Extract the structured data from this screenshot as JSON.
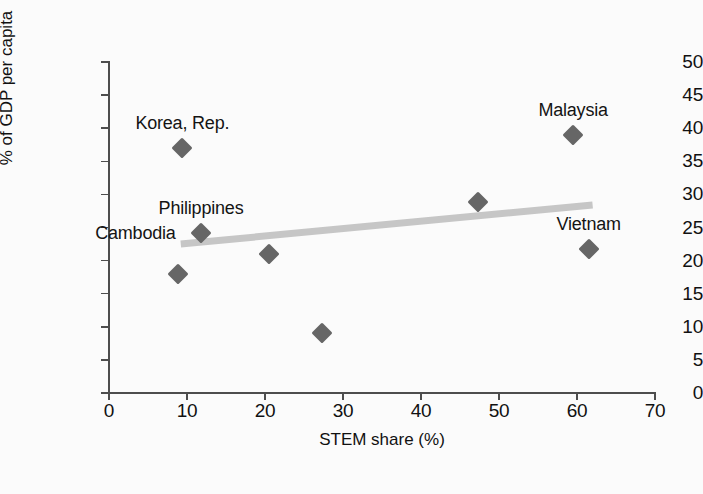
{
  "chart_data": {
    "type": "scatter",
    "title": "",
    "subtitle": "",
    "xlabel": "STEM share (%)",
    "ylabel": "% of GDP per capita",
    "xlim": [
      0,
      70
    ],
    "ylim": [
      0,
      50
    ],
    "xticks": [
      0,
      10,
      20,
      30,
      40,
      50,
      60,
      70
    ],
    "yticks": [
      0,
      5,
      10,
      15,
      20,
      25,
      30,
      35,
      40,
      45,
      50
    ],
    "grid": false,
    "legend": "none",
    "marker_shape": "diamond",
    "marker_color": "#666666",
    "points": [
      {
        "label": "Cambodia",
        "x": 8.8,
        "y": 18.0,
        "label_dx": -2,
        "label_dy": -30,
        "label_anchor": "end"
      },
      {
        "label": "Korea, Rep.",
        "x": 9.4,
        "y": 37.0,
        "label_dx": 0,
        "label_dy": -14,
        "label_anchor": "middle"
      },
      {
        "label": "Philippines",
        "x": 11.8,
        "y": 24.1,
        "label_dx": 0,
        "label_dy": -14,
        "label_anchor": "middle"
      },
      {
        "label": "",
        "x": 20.5,
        "y": 21.0,
        "label_dx": 0,
        "label_dy": 0,
        "label_anchor": "middle"
      },
      {
        "label": "",
        "x": 27.3,
        "y": 9.0,
        "label_dx": 0,
        "label_dy": 0,
        "label_anchor": "middle"
      },
      {
        "label": "",
        "x": 47.3,
        "y": 28.8,
        "label_dx": 0,
        "label_dy": 0,
        "label_anchor": "middle"
      },
      {
        "label": "Malaysia",
        "x": 59.5,
        "y": 39.0,
        "label_dx": 0,
        "label_dy": -14,
        "label_anchor": "middle"
      },
      {
        "label": "Vietnam",
        "x": 61.5,
        "y": 21.8,
        "label_dx": 0,
        "label_dy": -14,
        "label_anchor": "middle"
      }
    ],
    "trendline": {
      "x_start": 9.2,
      "y_start": 22.5,
      "x_end": 62.0,
      "y_end": 28.4,
      "color": "#c6c6c6"
    }
  }
}
